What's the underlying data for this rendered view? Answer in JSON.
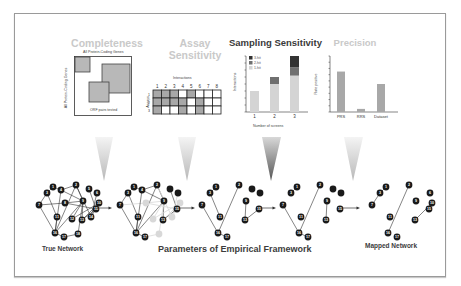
{
  "panels": {
    "completeness": {
      "title": "Completeness",
      "x_label": "All Protein-Coding Genes",
      "y_label": "All Protein-Coding Genes",
      "inner_label": "ORF pairs tested"
    },
    "assay_sensitivity": {
      "title_line1": "Assay",
      "title_line2": "Sensitivity",
      "col_header": "Interactions",
      "row_header": "Assays",
      "columns": [
        "1",
        "2",
        "3",
        "4",
        "5",
        "6",
        "7",
        "8"
      ],
      "rows": [
        "1",
        "2",
        "3"
      ],
      "grid": [
        [
          1,
          1,
          1,
          0,
          1,
          0,
          0,
          0
        ],
        [
          1,
          1,
          1,
          1,
          0,
          1,
          0,
          0
        ],
        [
          1,
          0,
          0,
          1,
          0,
          1,
          0,
          0
        ]
      ]
    },
    "sampling_sensitivity": {
      "title": "Sampling Sensitivity",
      "legend": [
        "3-hit",
        "2-hit",
        "1-hit"
      ],
      "y_label": "Interactions",
      "x_label": "Number of screens",
      "x_ticks": [
        "1",
        "2",
        "3"
      ]
    },
    "precision": {
      "title": "Precision",
      "y_label": "Rate positive",
      "x_ticks": [
        "PRS",
        "RRS",
        "Dataset"
      ]
    }
  },
  "chart_data": [
    {
      "type": "bar",
      "title": "Sampling Sensitivity",
      "xlabel": "Number of screens",
      "ylabel": "Interactions",
      "categories": [
        "1",
        "2",
        "3"
      ],
      "stacked": true,
      "series": [
        {
          "name": "1-hit",
          "values": [
            3,
            4,
            5.2
          ]
        },
        {
          "name": "2-hit",
          "values": [
            0,
            1,
            1.2
          ]
        },
        {
          "name": "3-hit",
          "values": [
            0,
            0,
            1.6
          ]
        }
      ],
      "ylim": [
        0,
        8
      ],
      "legend_position": "top-left"
    },
    {
      "type": "bar",
      "title": "Precision",
      "xlabel": "",
      "ylabel": "Rate positive",
      "categories": [
        "PRS",
        "RRS",
        "Dataset"
      ],
      "values": [
        6.5,
        0.5,
        4.5
      ],
      "ylim": [
        0,
        9
      ]
    }
  ],
  "labels": {
    "true_network": "True Network",
    "framework": "Parameters of Empirical Framework",
    "mapped_network": "Mapped Network"
  },
  "colors": {
    "node": "#1a1a1a",
    "node_text": "#ffffff",
    "edge": "#333333",
    "faded": "#d8d8d8",
    "bar_light": "#d4d4d4",
    "bar_mid": "#707070",
    "bar_dark": "#333333",
    "precision_bar": "#a8a8a8"
  }
}
